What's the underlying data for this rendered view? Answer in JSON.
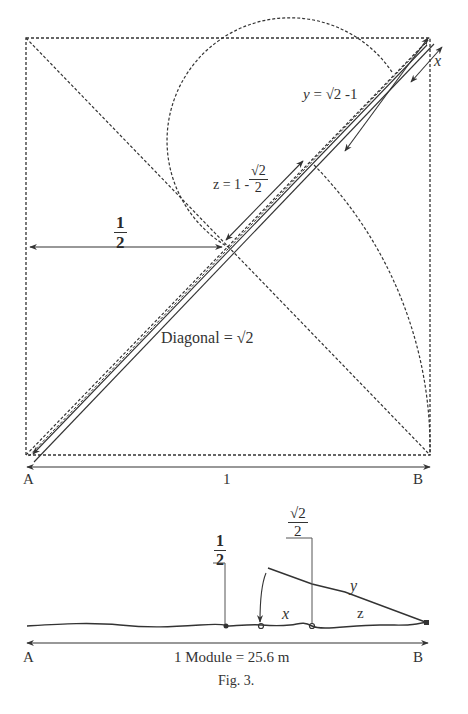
{
  "figure": {
    "caption": "Fig. 3.",
    "top_diagram": {
      "label_y": "y = √2 -1",
      "label_y_var": "y",
      "label_y_expr": "= √2 -1",
      "label_x": "x",
      "label_z_prefix": "z = 1 -",
      "label_z_num": "√2",
      "label_z_den": "2",
      "label_half_num": "1",
      "label_half_den": "2",
      "label_diagonal": "Diagonal = √2",
      "point_a": "A",
      "point_b": "B",
      "side_length": "1"
    },
    "bottom_diagram": {
      "label_half_num": "1",
      "label_half_den": "2",
      "label_sqrt2_num": "√2",
      "label_sqrt2_den": "2",
      "label_x": "x",
      "label_y": "y",
      "label_z": "z",
      "point_a": "A",
      "point_b": "B",
      "module_label": "1 Module = 25.6 m"
    }
  },
  "colors": {
    "ink": "#333333",
    "background": "#ffffff"
  }
}
